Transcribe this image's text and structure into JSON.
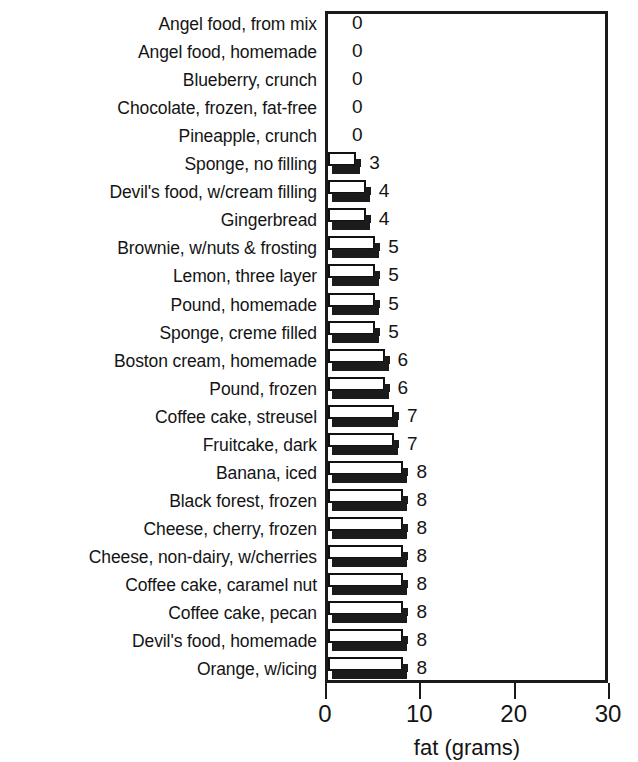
{
  "chart_data": {
    "type": "bar",
    "orientation": "horizontal",
    "title": "",
    "xlabel": "fat (grams)",
    "ylabel": "",
    "xlim": [
      0,
      30
    ],
    "xticks": [
      0,
      10,
      20,
      30
    ],
    "xtick_labels": [
      "0",
      "10",
      "20",
      "30"
    ],
    "grid": false,
    "legend": null,
    "value_labels": true,
    "categories": [
      "Angel food, from mix",
      "Angel food, homemade",
      "Blueberry, crunch",
      "Chocolate, frozen, fat-free",
      "Pineapple, crunch",
      "Sponge, no filling",
      "Devil's food, w/cream filling",
      "Gingerbread",
      "Brownie, w/nuts & frosting",
      "Lemon, three layer",
      "Pound, homemade",
      "Sponge, creme filled",
      "Boston cream, homemade",
      "Pound, frozen",
      "Coffee cake, streusel",
      "Fruitcake, dark",
      "Banana, iced",
      "Black forest, frozen",
      "Cheese, cherry, frozen",
      "Cheese, non-dairy, w/cherries",
      "Coffee cake, caramel nut",
      "Coffee cake, pecan",
      "Devil's food, homemade",
      "Orange, w/icing"
    ],
    "values": [
      0,
      0,
      0,
      0,
      0,
      3,
      4,
      4,
      5,
      5,
      5,
      5,
      6,
      6,
      7,
      7,
      8,
      8,
      8,
      8,
      8,
      8,
      8,
      8
    ],
    "value_label_texts": [
      "0",
      "0",
      "0",
      "0",
      "0",
      "3",
      "4",
      "4",
      "5",
      "5",
      "5",
      "5",
      "6",
      "6",
      "7",
      "7",
      "8",
      "8",
      "8",
      "8",
      "8",
      "8",
      "8",
      "8"
    ]
  },
  "style": {
    "bar_face_color": "#ffffff",
    "bar_edge_color": "#111111",
    "bar_shadow_color": "#1b1b1b",
    "axis_color": "#1a1a1a",
    "text_color": "#141414",
    "background": "#ffffff"
  }
}
